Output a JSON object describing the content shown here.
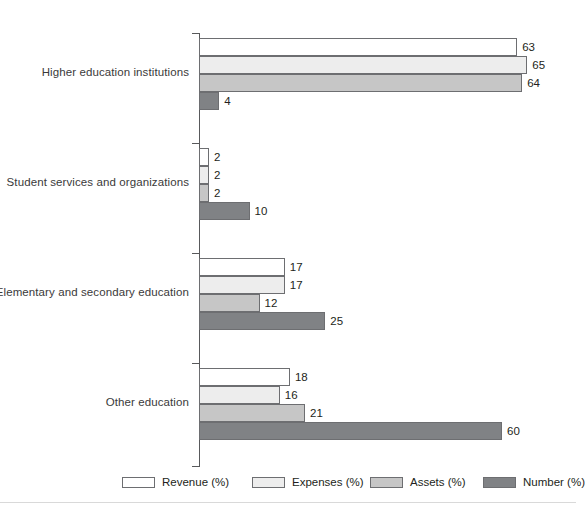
{
  "chart_data": {
    "type": "bar",
    "orientation": "horizontal",
    "title": "",
    "xlabel": "",
    "ylabel": "",
    "xlim": [
      0,
      70
    ],
    "grid": false,
    "legend_position": "bottom",
    "categories": [
      "Higher education institutions",
      "Student services and organizations",
      "Elementary and secondary education",
      "Other education"
    ],
    "series": [
      {
        "name": "Revenue (%)",
        "color": "#ffffff",
        "values": [
          63,
          2,
          17,
          18
        ]
      },
      {
        "name": "Expenses (%)",
        "color": "#ededed",
        "values": [
          65,
          2,
          17,
          16
        ]
      },
      {
        "name": "Assets (%)",
        "color": "#c6c6c6",
        "values": [
          64,
          2,
          12,
          21
        ]
      },
      {
        "name": "Number (%)",
        "color": "#808285",
        "values": [
          4,
          10,
          25,
          60
        ]
      }
    ]
  },
  "legend": {
    "items": [
      {
        "label": "Revenue (%)",
        "color": "#ffffff"
      },
      {
        "label": "Expenses (%)",
        "color": "#ededed"
      },
      {
        "label": "Assets (%)",
        "color": "#c6c6c6"
      },
      {
        "label": "Number (%)",
        "color": "#808285"
      }
    ]
  },
  "axis": {
    "line_color": "#58595b"
  }
}
